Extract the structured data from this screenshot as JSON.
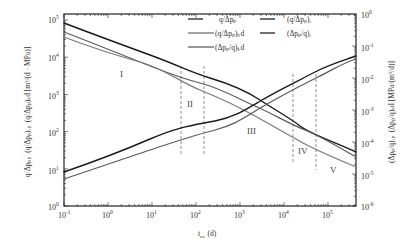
{
  "chart_data": {
    "type": "line",
    "title": "",
    "xlabel": "t_ca (d)",
    "ylabel_left": "q/Δp_p, (q/Δp_p)_i, (q/Δp_p)_sd [m^3/(d·MPa)]",
    "ylabel_right": "(Δp_p/q)_i, (Δp_p/q)_sd [MPa/(m^3/d)]",
    "xscale": "log",
    "yscale_left": "log",
    "yscale_right": "log",
    "xlim": [
      0.1,
      440000
    ],
    "ylim_left": [
      1,
      1000000
    ],
    "ylim_right": [
      1e-06,
      1
    ],
    "x_tick_labels": [
      "10^-1",
      "10^0",
      "10^1",
      "10^2",
      "10^3",
      "10^4",
      "10^5"
    ],
    "y_left_tick_labels": [
      "10^0",
      "10^1",
      "10^2",
      "10^3",
      "10^4",
      "10^5"
    ],
    "y_right_tick_labels": [
      "10^-6",
      "10^-5",
      "10^-4",
      "10^-3",
      "10^-2",
      "10^-1",
      "10^0"
    ],
    "grid": false,
    "legend_position": "top-right inside",
    "legend": [
      {
        "label": "q/Δp_p",
        "color": "#222222"
      },
      {
        "label": "(q/Δp_p)_i",
        "color": "#222222"
      },
      {
        "label": "(q/Δp_p)_sd",
        "color": "#666666"
      },
      {
        "label": "(Δp_p/q)_i",
        "color": "#222222"
      },
      {
        "label": "(Δp_p/q)_sd",
        "color": "#555555"
      }
    ],
    "series": [
      {
        "name": "q/Δp_p",
        "axis": "left",
        "color": "#1a1a1a",
        "x": [
          0.1,
          1,
          10,
          100,
          1000,
          10000,
          100000,
          440000
        ],
        "y": [
          120000,
          40000,
          12000,
          4500,
          1200,
          220,
          45,
          18
        ]
      },
      {
        "name": "(q/Δp_p)_i",
        "axis": "left",
        "color": "#5a5a5a",
        "x": [
          0.1,
          1,
          10,
          100,
          1000,
          10000,
          100000,
          440000
        ],
        "y": [
          70000,
          20000,
          5000,
          1600,
          500,
          110,
          25,
          12
        ]
      },
      {
        "name": "(q/Δp_p)_sd",
        "axis": "left",
        "color": "#7a7a7a",
        "x": [
          0.1,
          1,
          10,
          100,
          1000,
          10000,
          100000,
          440000
        ],
        "y": [
          55000,
          16000,
          5500,
          1200,
          320,
          65,
          12,
          5
        ]
      },
      {
        "name": "(Δp_p/q)_i",
        "axis": "right",
        "color": "#1a1a1a",
        "x": [
          0.1,
          1,
          10,
          100,
          1000,
          10000,
          100000,
          440000
        ],
        "y": [
          9e-06,
          2.5e-05,
          8e-05,
          0.00018,
          0.0005,
          0.003,
          0.02,
          0.07
        ]
      },
      {
        "name": "(Δp_p/q)_sd",
        "axis": "right",
        "color": "#5a5a5a",
        "x": [
          0.1,
          1,
          10,
          100,
          1000,
          10000,
          100000,
          440000
        ],
        "y": [
          6e-06,
          1.8e-05,
          5e-05,
          0.0001,
          0.00035,
          0.0022,
          0.014,
          0.06
        ]
      }
    ],
    "vertical_dashed_lines_x": [
      60,
      190,
      30000,
      100000
    ],
    "annotations": [
      {
        "text": "I",
        "x": 2.5,
        "y_left": 3000
      },
      {
        "text": "II",
        "x": 110,
        "y_left": 350
      },
      {
        "text": "III",
        "x": 3000,
        "y_left": 55
      },
      {
        "text": "IV",
        "x": 50000,
        "y_left": 15
      },
      {
        "text": "V",
        "x": 250000,
        "y_left": 4
      }
    ]
  },
  "labels": {
    "x_ticks": [
      "10",
      "10",
      "10",
      "10",
      "10",
      "10",
      "10"
    ],
    "x_exps": [
      "-1",
      "0",
      "1",
      "2",
      "3",
      "4",
      "5"
    ],
    "y_left_exps": [
      "5",
      "4",
      "3",
      "2",
      "1",
      "0"
    ],
    "y_right_exps": [
      "0",
      "-1",
      "-2",
      "-3",
      "-4",
      "-5",
      "-6"
    ],
    "xlabel_main": "t",
    "xlabel_sub": "ca",
    "xlabel_unit": "(d)",
    "ylabel_left": "q/Δpₚ，(q/Δpₚ)ᵢ，(q/Δpₚ)ₛd [m³/(d · MPa)]",
    "ylabel_right": "(Δpₚ/q)ᵢ，(Δpₚ/q)ₛd [MPa/(m³/d)]",
    "legend": [
      "q/Δpₚ",
      "(q/Δpₚ)ᵢ",
      "(q/Δpₚ)ₛd",
      "(Δpₚ/q)ᵢ",
      "(Δpₚ/q)ₛd"
    ],
    "zones": [
      "I",
      "II",
      "III",
      "IV",
      "V"
    ]
  }
}
